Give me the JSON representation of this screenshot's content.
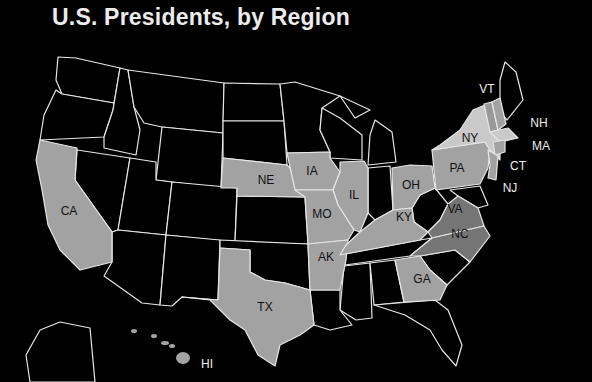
{
  "title": "U.S. Presidents, by Region",
  "colors": {
    "background": "#000000",
    "none": "#000000",
    "light": "#c9c9c9",
    "medium": "#a2a2a2",
    "dark": "#757575",
    "border": "#e6e6e6"
  },
  "labels": {
    "CA": "CA",
    "NE": "NE",
    "IA": "IA",
    "IL": "IL",
    "MO": "MO",
    "AK": "AK",
    "TX": "TX",
    "OH": "OH",
    "KY": "KY",
    "PA": "PA",
    "NY": "NY",
    "VA": "VA",
    "NC": "NC",
    "GA": "GA",
    "VT": "VT",
    "NH": "NH",
    "MA": "MA",
    "CT": "CT",
    "NJ": "NJ",
    "HI": "HI"
  }
}
